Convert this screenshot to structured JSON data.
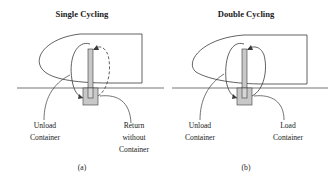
{
  "figure": {
    "panels": [
      {
        "id": "a",
        "title": "Single Cycling",
        "caption": "(a)",
        "labels": {
          "left_line1": "Unload",
          "left_line2": "Container",
          "right_line1": "Return",
          "right_line2": "without",
          "right_line3": "Container"
        },
        "return_path_style": "dashed"
      },
      {
        "id": "b",
        "title": "Double Cycling",
        "caption": "(b)",
        "labels": {
          "left_line1": "Unload",
          "left_line2": "Container",
          "right_line1": "Load",
          "right_line2": "Container"
        },
        "return_path_style": "solid"
      }
    ],
    "colors": {
      "line": "#3a3a3a",
      "container_fill": "#c8c8c8",
      "background": "#ffffff"
    }
  }
}
